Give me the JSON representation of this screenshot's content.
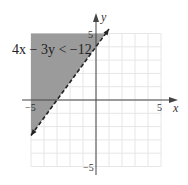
{
  "chart_data": {
    "type": "inequality-graph",
    "title": "",
    "inequality_label": "4x − 3y < −12",
    "boundary_line": {
      "equation": "4x - 3y = -12",
      "slope": 1.3333,
      "y_intercept": 4,
      "x_intercept": -3,
      "style": "dashed"
    },
    "shaded_region": "above-left of boundary line",
    "xlabel": "x",
    "ylabel": "y",
    "xlim": [
      -5,
      5
    ],
    "ylim": [
      -5,
      5
    ],
    "grid": true,
    "x_ticks": [
      {
        "value": -5,
        "label": "−5"
      },
      {
        "value": 5,
        "label": "5"
      }
    ],
    "y_ticks": [
      {
        "value": 5,
        "label": "5"
      },
      {
        "value": -5,
        "label": "−5"
      }
    ],
    "colors": {
      "shade": "#9b9b9b",
      "grid": "#e6e6e6",
      "axis": "#444444",
      "line": "#222222"
    }
  }
}
